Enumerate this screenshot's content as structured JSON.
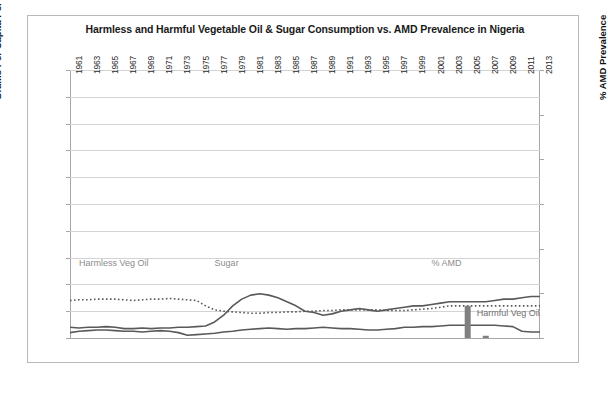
{
  "chart": {
    "title": "Harmless and Harmful Vegetable Oil & Sugar Consumption vs. AMD Prevalence in Nigeria",
    "y_left_label": "Grams Per Capita Per Day",
    "y_right_label": "% AMD Prevalence",
    "annotations": {
      "harmless": "Harmless Veg Oil",
      "sugar": "Sugar",
      "amd": "% AMD",
      "harmful": "Harmful Veg Oil"
    },
    "colors": {
      "line": "#595959",
      "annotation": "#8c8c8c",
      "grid": "#d3d3d3",
      "axis": "#a6a6a6",
      "bar": "#808080"
    }
  },
  "chart_data": {
    "type": "line",
    "title": "Harmless and Harmful Vegetable Oil & Sugar Consumption vs. AMD Prevalence in Nigeria",
    "xlabel": "",
    "ylabel": "Grams Per Capita Per Day",
    "y2label": "% AMD Prevalence",
    "ylim": [
      0,
      200
    ],
    "y2lim": [
      0,
      30
    ],
    "yticks": [
      0,
      20,
      40,
      60,
      80,
      100,
      120,
      140,
      160,
      180,
      200
    ],
    "y2ticks": [
      0,
      5,
      10,
      15,
      20,
      25,
      30
    ],
    "grid": true,
    "legend": "inline-labels",
    "x": [
      1961,
      1962,
      1963,
      1964,
      1965,
      1966,
      1967,
      1968,
      1969,
      1970,
      1971,
      1972,
      1973,
      1974,
      1975,
      1976,
      1977,
      1978,
      1979,
      1980,
      1981,
      1982,
      1983,
      1984,
      1985,
      1986,
      1987,
      1988,
      1989,
      1990,
      1991,
      1992,
      1993,
      1994,
      1995,
      1996,
      1997,
      1998,
      1999,
      2000,
      2001,
      2002,
      2003,
      2004,
      2005,
      2006,
      2007,
      2008,
      2009,
      2010,
      2011,
      2012,
      2013
    ],
    "xticklabels": [
      "1961",
      "1963",
      "1965",
      "1967",
      "1969",
      "1971",
      "1973",
      "1975",
      "1977",
      "1979",
      "1981",
      "1983",
      "1985",
      "1987",
      "1989",
      "1991",
      "1993",
      "1995",
      "1997",
      "1999",
      "2001",
      "2003",
      "2005",
      "2007",
      "2009",
      "2011",
      "2013"
    ],
    "series": [
      {
        "name": "Harmless Veg Oil",
        "style": "dotted",
        "axis": "left",
        "values": [
          28,
          28.5,
          28.5,
          29,
          29,
          29,
          28.5,
          28,
          28.5,
          29,
          29,
          29.5,
          29,
          28.5,
          28,
          24,
          21,
          20,
          19.5,
          19,
          18.5,
          18.5,
          19,
          19,
          19.5,
          19.5,
          20,
          20,
          20.5,
          20.5,
          21,
          21,
          21,
          21,
          21,
          20.5,
          20.5,
          20.5,
          21,
          21.5,
          22,
          23,
          24,
          24,
          24,
          24,
          24,
          24,
          24,
          24,
          24,
          24,
          24
        ]
      },
      {
        "name": "Sugar",
        "style": "solid",
        "axis": "left",
        "values": [
          8,
          7.5,
          8,
          8,
          8.5,
          8,
          7,
          7,
          7.5,
          7,
          7.5,
          7.5,
          8,
          8,
          8.5,
          9,
          12,
          17,
          24,
          29,
          32,
          33,
          32,
          30,
          27,
          24,
          20,
          19,
          17,
          18,
          20,
          21,
          22,
          21,
          20,
          21,
          22,
          23,
          24,
          24,
          25,
          26,
          27,
          27,
          27,
          27,
          27,
          28,
          29,
          29,
          30,
          31,
          31
        ]
      },
      {
        "name": "Harmful Veg Oil",
        "style": "solid",
        "axis": "left",
        "values": [
          4,
          5,
          5.5,
          6,
          6,
          5.5,
          5,
          5,
          4.5,
          5,
          5.5,
          5,
          4,
          2,
          2.5,
          3,
          3.5,
          4.5,
          5,
          6,
          6.5,
          7,
          7.5,
          7,
          6.5,
          7,
          7,
          7.5,
          8,
          7.5,
          7,
          7,
          6.5,
          6,
          6,
          6.5,
          7,
          8,
          8,
          8.5,
          8.5,
          9,
          9.5,
          9.5,
          9.5,
          9.5,
          9.5,
          9.5,
          9,
          8.5,
          5,
          4.5,
          4.5
        ]
      },
      {
        "name": "% AMD",
        "style": "bar",
        "axis": "right",
        "points": [
          {
            "x": 2005,
            "y": 3.6
          },
          {
            "x": 2007,
            "y": 0.25
          }
        ]
      }
    ]
  }
}
